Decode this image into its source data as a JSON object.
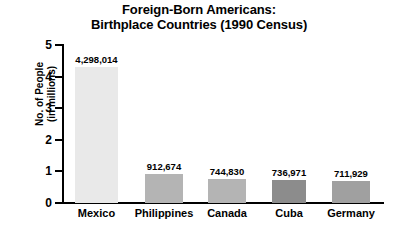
{
  "chart_data": {
    "type": "bar",
    "title": "Foreign-Born Americans: Birthplace Countries (1990 Census)",
    "title_line1": "Foreign-Born Americans:",
    "title_line2": "Birthplace Countries (1990 Census)",
    "xlabel": "",
    "ylabel": "No. of People (in millions)",
    "ylabel_line1": "No. of People",
    "ylabel_line2": "(in millions)",
    "categories": [
      "Mexico",
      "Philippines",
      "Canada",
      "Cuba",
      "Germany"
    ],
    "values": [
      4.298014,
      0.912674,
      0.74483,
      0.736971,
      0.711929
    ],
    "value_labels": [
      "4,298,014",
      "912,674",
      "744,830",
      "736,971",
      "711,929"
    ],
    "bar_colors": [
      "#e9e9e9",
      "#b4b4b4",
      "#b4b4b4",
      "#8c8c8c",
      "#a0a0a0"
    ],
    "ylim": [
      0,
      5
    ],
    "yticks": [
      5,
      4,
      3,
      2,
      1,
      0
    ],
    "ytick_labels": [
      "5",
      "4",
      "3",
      "2",
      "1",
      "0"
    ],
    "grid": false,
    "legend": "none",
    "axis_color": "#000000",
    "background": "#ffffff"
  }
}
